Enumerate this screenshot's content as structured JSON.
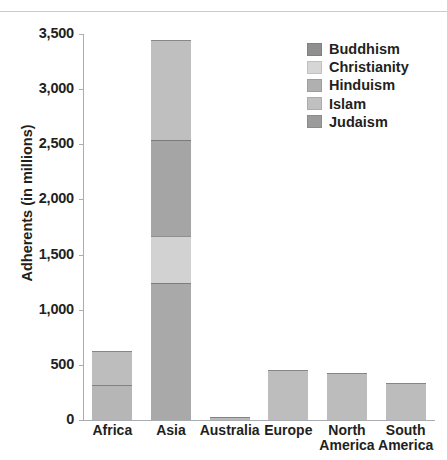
{
  "chart_data": {
    "type": "bar",
    "subtype": "stacked-vertical",
    "title": "",
    "xlabel": "",
    "ylabel": "Adherents (in millions)",
    "ylim": [
      0,
      3500
    ],
    "ytick_values": [
      0,
      500,
      1000,
      1500,
      2000,
      2500,
      3000,
      3500
    ],
    "ytick_labels": [
      "0",
      "500",
      "1,000",
      "1,500",
      "2,000",
      "2,500",
      "3,000",
      "3,500"
    ],
    "grid": false,
    "legend_position": "top-right",
    "categories": [
      "Africa",
      "Asia",
      "Australia",
      "Europe",
      "North America",
      "South America"
    ],
    "category_label_lines": [
      [
        "Africa"
      ],
      [
        "Asia"
      ],
      [
        "Australia"
      ],
      [
        "Europe"
      ],
      [
        "North",
        "America"
      ],
      [
        "South",
        "America"
      ]
    ],
    "series": [
      {
        "name": "Buddhism",
        "color": "#8c8c8c",
        "values": [
          5,
          420,
          1,
          2,
          4,
          1
        ]
      },
      {
        "name": "Christianity",
        "color": "#d4d4d4",
        "values": [
          310,
          420,
          14,
          448,
          424,
          337
        ]
      },
      {
        "name": "Hinduism",
        "color": "#a8a8a8",
        "values": [
          2,
          875,
          1,
          1,
          2,
          1
        ]
      },
      {
        "name": "Islam",
        "color": "#bdbdbd",
        "values": [
          315,
          1245,
          8,
          1,
          2,
          1
        ]
      },
      {
        "name": "Judaism",
        "color": "#9a9a9a",
        "values": [
          1,
          10,
          1,
          2,
          6,
          1
        ]
      }
    ],
    "stack_order_bottom_to_top": [
      "Islam",
      "Hinduism",
      "Christianity",
      "Buddhism"
    ],
    "totals": [
      633,
      2970,
      25,
      454,
      438,
      341
    ],
    "bar_segments": [
      {
        "category": "Africa",
        "top_value": 630,
        "segments": [
          {
            "label": "Islam",
            "from": 0,
            "to": 320,
            "color": "#b6b6b6"
          },
          {
            "label": "Christianity",
            "from": 320,
            "to": 630,
            "color": "#bdbdbd"
          }
        ]
      },
      {
        "category": "Asia",
        "top_value": 3450,
        "segments": [
          {
            "label": "Islam",
            "from": 0,
            "to": 1245,
            "color": "#a9a9a9"
          },
          {
            "label": "Hinduism",
            "from": 1245,
            "to": 1665,
            "color": "#d2d2d2"
          },
          {
            "label": "Buddhism",
            "from": 1665,
            "to": 2540,
            "color": "#a5a5a5"
          },
          {
            "label": "Christianity",
            "from": 2540,
            "to": 3450,
            "color": "#bfbfbf"
          }
        ]
      },
      {
        "category": "Australia",
        "top_value": 25,
        "segments": [
          {
            "label": "Christianity",
            "from": 0,
            "to": 25,
            "color": "#b9b9b9"
          }
        ]
      },
      {
        "category": "Europe",
        "top_value": 450,
        "segments": [
          {
            "label": "Christianity",
            "from": 0,
            "to": 450,
            "color": "#bdbdbd"
          }
        ]
      },
      {
        "category": "North America",
        "top_value": 430,
        "segments": [
          {
            "label": "Christianity",
            "from": 0,
            "to": 430,
            "color": "#bcbcbc"
          }
        ]
      },
      {
        "category": "South America",
        "top_value": 340,
        "segments": [
          {
            "label": "Christianity",
            "from": 0,
            "to": 340,
            "color": "#bcbcbc"
          }
        ]
      }
    ],
    "legend": [
      {
        "label": "Buddhism",
        "color": "#8f8f8f"
      },
      {
        "label": "Christianity",
        "color": "#d6d6d6"
      },
      {
        "label": "Hinduism",
        "color": "#b0b0b0"
      },
      {
        "label": "Islam",
        "color": "#c0c0c0"
      },
      {
        "label": "Judaism",
        "color": "#9b9b9b"
      }
    ]
  }
}
